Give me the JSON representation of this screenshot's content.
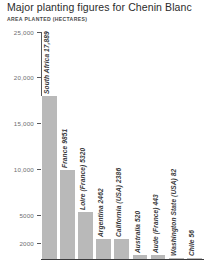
{
  "header": {
    "title": "Major planting figures for Chenin Blanc",
    "subtitle": "AREA PLANTED (HECTARES)"
  },
  "chart_data": {
    "type": "bar",
    "title": "Major planting figures for Chenin Blanc",
    "subtitle": "AREA PLANTED (HECTARES)",
    "xlabel": "",
    "ylabel": "AREA PLANTED (HECTARES)",
    "orientation": "vertical",
    "grid": false,
    "legend": null,
    "bar_color": "#b9b9b9",
    "axis_color": "#58585a",
    "ytick_labels": [
      "25,000",
      "20,000",
      "15,000",
      "10,000",
      "5000",
      "2000"
    ],
    "ytick_values": [
      25000,
      20000,
      15000,
      10000,
      5000,
      2000
    ],
    "yaxis_note": "non-linear: 2000 and 5000 ticks compressed near baseline",
    "ylim": [
      0,
      25000
    ],
    "categories": [
      "South Africa",
      "France",
      "Loire (France)",
      "Argentina",
      "California (USA)",
      "Australia",
      "Aude (France)",
      "Washington State (USA)",
      "Chile"
    ],
    "values": [
      17889,
      9851,
      5320,
      2462,
      2386,
      520,
      443,
      82,
      56
    ],
    "point_labels": [
      "South Africa 17,889",
      "France 9851",
      "Loire (France) 5320",
      "Argentina 2462",
      "California (USA) 2386",
      "Australia 520",
      "Aude (France) 443",
      "Washington State (USA) 82",
      "Chile 56"
    ]
  }
}
